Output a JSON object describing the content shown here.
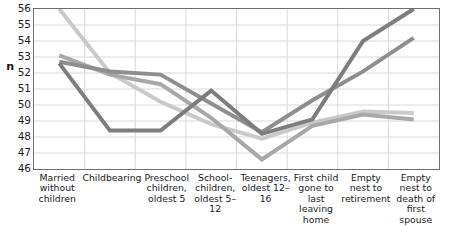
{
  "chart_data": {
    "type": "line",
    "title": "",
    "xlabel": "",
    "ylabel": "n",
    "ylim": [
      46,
      56
    ],
    "yticks": [
      56,
      55,
      54,
      53,
      52,
      51,
      50,
      49,
      48,
      47,
      46
    ],
    "grid": true,
    "legend": "none",
    "categories": [
      "Married without children",
      "Childbearing",
      "Preschool children, oldest 5",
      "School-children, oldest 5–12",
      "Teenagers, oldest 12–16",
      "First child gone to last leaving home",
      "Empty nest to retirement",
      "Empty nest to death of first spouse"
    ],
    "series": [
      {
        "name": "series-1",
        "color": "#c9c9c9",
        "values": [
          56.0,
          52.0,
          50.2,
          48.8,
          47.9,
          48.9,
          49.6,
          49.5
        ]
      },
      {
        "name": "series-2",
        "color": "#a8a8a8",
        "values": [
          53.1,
          51.9,
          51.3,
          49.2,
          46.6,
          48.7,
          49.4,
          49.1
        ]
      },
      {
        "name": "series-3",
        "color": "#8e8e8e",
        "values": [
          52.7,
          52.1,
          51.9,
          50.1,
          48.3,
          50.3,
          52.1,
          54.2
        ]
      },
      {
        "name": "series-4",
        "color": "#7d7d7d",
        "values": [
          52.6,
          48.4,
          48.4,
          50.9,
          48.2,
          49.1,
          54.0,
          56.0
        ]
      }
    ]
  }
}
